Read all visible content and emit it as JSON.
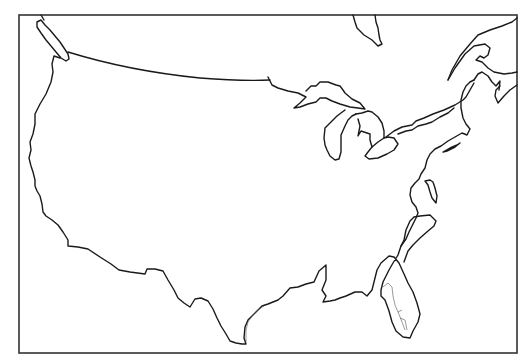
{
  "map": {
    "title": "Outline map of the contiguous United States",
    "type": "blank outline map",
    "region": "Contiguous United States with Great Lakes and southern Canada coastline",
    "labels": [],
    "colors": {
      "background": "#ffffff",
      "lines": "#1a1a1a",
      "frame": "#333333"
    },
    "frame": {
      "left": 19,
      "top": 15,
      "right": 517,
      "bottom": 353
    },
    "features": [
      "pacific-coast",
      "canada-border",
      "great-lakes",
      "hudson-bay-tip",
      "gulf-of-st-lawrence",
      "atlantic-coast",
      "florida-peninsula",
      "gulf-coast",
      "mexico-border"
    ]
  }
}
